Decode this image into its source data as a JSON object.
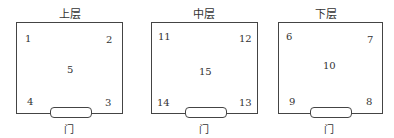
{
  "floors": [
    {
      "title": "上层",
      "door_label": "门",
      "positions": {
        "top_left": "1",
        "top_right": "2",
        "center": "5",
        "bottom_left": "4",
        "bottom_right": "3"
      }
    },
    {
      "title": "中层",
      "door_label": "门",
      "positions": {
        "top_left": "11",
        "top_right": "12",
        "center": "15",
        "bottom_left": "14",
        "bottom_right": "13"
      }
    },
    {
      "title": "下层",
      "door_label": "门",
      "positions": {
        "top_left": "6",
        "top_right": "7",
        "center": "10",
        "bottom_left": "9",
        "bottom_right": "8"
      }
    }
  ]
}
